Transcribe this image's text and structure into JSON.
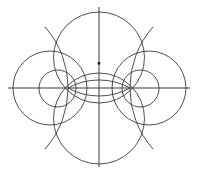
{
  "diagram": {
    "title": "",
    "colors": {
      "background": "#ffffff",
      "stroke": "#3a3a3a",
      "point": "#111111"
    },
    "axes": {
      "horizontal": {
        "x1": 8,
        "y1": 88,
        "x2": 190,
        "y2": 88
      },
      "vertical": {
        "x1": 99,
        "y1": 7,
        "x2": 99,
        "y2": 167
      }
    },
    "circles": [
      {
        "name": "top-circle",
        "cx": 99,
        "cy": 57.5,
        "r": 45.5
      },
      {
        "name": "bottom-circle",
        "cx": 99,
        "cy": 118.5,
        "r": 45.5
      },
      {
        "name": "left-large-circle",
        "cx": 50,
        "cy": 88,
        "r": 37
      },
      {
        "name": "left-small-circle",
        "cx": 57.5,
        "cy": 88.5,
        "r": 18.5
      },
      {
        "name": "right-large-circle",
        "cx": 149,
        "cy": 88,
        "r": 37
      },
      {
        "name": "right-small-circle",
        "cx": 140.5,
        "cy": 88.5,
        "r": 18.5
      }
    ],
    "arcs": [
      {
        "name": "left-outer-arc",
        "d": "M 45 27 A 92 92 0 0 1 45 149"
      },
      {
        "name": "right-outer-arc",
        "d": "M 153 27 A 92 92 0 0 0 153 149"
      },
      {
        "name": "lens-upper-arc",
        "d": "M 68 88 A 64 64 0 0 1 130 88"
      },
      {
        "name": "lens-lower-arc",
        "d": "M 68 88 A 64 64 0 0 0 130 88"
      }
    ],
    "points": [
      {
        "name": "center-point",
        "x": 99,
        "y": 63.3
      },
      {
        "name": "left-intersection",
        "x": 68,
        "y": 88
      },
      {
        "name": "right-intersection",
        "x": 130,
        "y": 88
      }
    ]
  }
}
